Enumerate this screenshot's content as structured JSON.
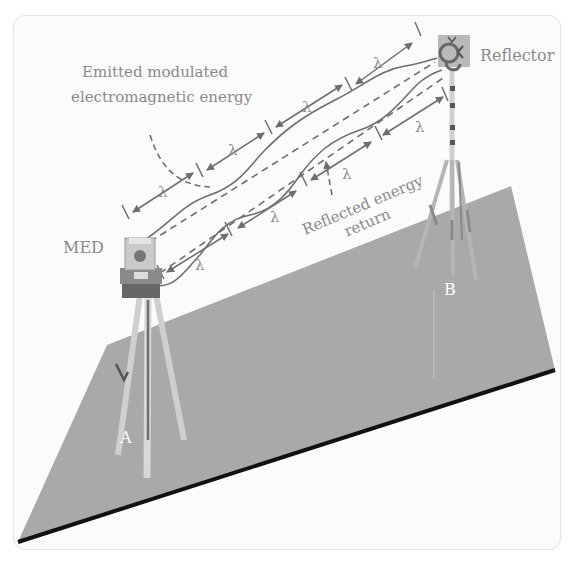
{
  "diagram": {
    "labels": {
      "emitted_line1": "Emitted modulated",
      "emitted_line2": "electromagnetic energy",
      "reflector": "Reflector",
      "med": "MED",
      "reflected_line1": "Reflected energy",
      "reflected_line2": "return",
      "point_a": "A",
      "point_b": "B",
      "wavelength_symbol": "λ"
    },
    "wavelength_markers": {
      "upper_row": [
        "λ",
        "λ",
        "λ",
        "λ"
      ],
      "lower_row": [
        "λ",
        "λ",
        "λ",
        "λ"
      ]
    },
    "colors": {
      "ground": "#a9a9a9",
      "ground_edge": "#111111",
      "wave": "#6e6e6e",
      "text": "#8a8a8a",
      "point_label": "#ffffff",
      "background": "#fbfbfb"
    }
  }
}
